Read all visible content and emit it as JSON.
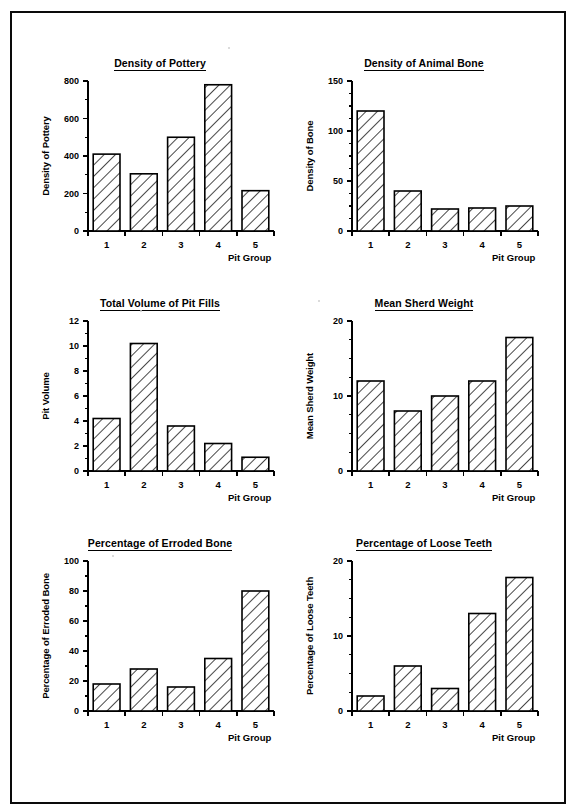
{
  "page": {
    "border_color": "#0a0a0a",
    "background": "#ffffff",
    "axis_color": "#000000",
    "bar_fill": "#ffffff",
    "bar_hatch_color": "#1a1a1a"
  },
  "charts": [
    {
      "id": "density-of-pottery",
      "position": "top-left",
      "chart_data": {
        "type": "bar",
        "title": "Density of Pottery",
        "xlabel": "Pit Group",
        "ylabel": "Density of Pottery",
        "categories": [
          "1",
          "2",
          "3",
          "4",
          "5"
        ],
        "values": [
          410,
          305,
          500,
          780,
          215
        ],
        "ylim": [
          0,
          800
        ],
        "yticks": [
          0,
          200,
          400,
          600,
          800
        ],
        "ytick_labels": [
          "0",
          "200",
          "400",
          "600",
          "800"
        ],
        "minor_tick_step": 100,
        "grid": false,
        "legend": false
      }
    },
    {
      "id": "density-of-animal-bone",
      "position": "top-right",
      "chart_data": {
        "type": "bar",
        "title": "Density of Animal Bone",
        "xlabel": "Pit Group",
        "ylabel": "Density of Bone",
        "categories": [
          "1",
          "2",
          "3",
          "4",
          "5"
        ],
        "values": [
          120,
          40,
          22,
          23,
          25
        ],
        "ylim": [
          0,
          150
        ],
        "yticks": [
          0,
          50,
          100,
          150
        ],
        "ytick_labels": [
          "0",
          "50",
          "100",
          "150"
        ],
        "minor_tick_step": 12.5,
        "grid": false,
        "legend": false
      }
    },
    {
      "id": "total-volume-of-pit-fills",
      "position": "middle-left",
      "chart_data": {
        "type": "bar",
        "title": "Total Volume of Pit Fills",
        "xlabel": "Pit Group",
        "ylabel": "Pit Volume",
        "categories": [
          "1",
          "2",
          "3",
          "4",
          "5"
        ],
        "values": [
          4.2,
          10.2,
          3.6,
          2.2,
          1.1
        ],
        "ylim": [
          0,
          12
        ],
        "yticks": [
          0,
          2,
          4,
          6,
          8,
          10,
          12
        ],
        "ytick_labels": [
          "0",
          "2",
          "4",
          "6",
          "8",
          "10",
          "12"
        ],
        "minor_tick_step": 1,
        "grid": false,
        "legend": false
      }
    },
    {
      "id": "mean-sherd-weight",
      "position": "middle-right",
      "chart_data": {
        "type": "bar",
        "title": "Mean Sherd Weight",
        "xlabel": "Pit Group",
        "ylabel": "Mean Sherd Weight",
        "categories": [
          "1",
          "2",
          "3",
          "4",
          "5"
        ],
        "values": [
          12,
          8,
          10,
          12,
          17.8
        ],
        "ylim": [
          0,
          20
        ],
        "yticks": [
          0,
          10,
          20
        ],
        "ytick_labels": [
          "0",
          "10",
          "20"
        ],
        "minor_tick_step": 2.5,
        "grid": false,
        "legend": false
      }
    },
    {
      "id": "percentage-of-erroded-bone",
      "position": "bottom-left",
      "chart_data": {
        "type": "bar",
        "title": "Percentage of Erroded Bone",
        "xlabel": "Pit Group",
        "ylabel": "Percentage of Erroded Bone",
        "categories": [
          "1",
          "2",
          "3",
          "4",
          "5"
        ],
        "values": [
          18,
          28,
          16,
          35,
          80
        ],
        "ylim": [
          0,
          100
        ],
        "yticks": [
          0,
          20,
          40,
          60,
          80,
          100
        ],
        "ytick_labels": [
          "0",
          "20",
          "40",
          "60",
          "80",
          "100"
        ],
        "minor_tick_step": 10,
        "grid": false,
        "legend": false
      }
    },
    {
      "id": "percentage-of-loose-teeth",
      "position": "bottom-right",
      "chart_data": {
        "type": "bar",
        "title": "Percentage of Loose Teeth",
        "xlabel": "Pit Group",
        "ylabel": "Percentage of Loose Teeth",
        "categories": [
          "1",
          "2",
          "3",
          "4",
          "5"
        ],
        "values": [
          2,
          6,
          3,
          13,
          17.8
        ],
        "ylim": [
          0,
          20
        ],
        "yticks": [
          0,
          10,
          20
        ],
        "ytick_labels": [
          "0",
          "10",
          "20"
        ],
        "minor_tick_step": 2.5,
        "grid": false,
        "legend": false
      }
    }
  ]
}
